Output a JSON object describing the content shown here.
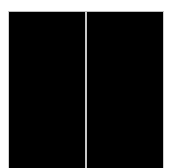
{
  "layout": {
    "background_color": "#ffffff",
    "panel_color": "#000000",
    "divider_color": "#c8c8c8"
  },
  "panels": [
    {
      "name": "left-panel",
      "content": ""
    },
    {
      "name": "right-panel",
      "content": ""
    }
  ]
}
